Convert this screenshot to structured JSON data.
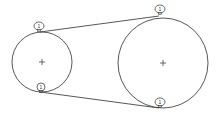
{
  "diagram": {
    "type": "belt-pulley",
    "stroke_color": "#444444",
    "background": "#ffffff",
    "pulleys": [
      {
        "id": "small-pulley",
        "cx": 42,
        "cy": 62,
        "r": 30,
        "center_mark": "+"
      },
      {
        "id": "large-pulley",
        "cx": 163,
        "cy": 63,
        "r": 45,
        "center_mark": "+"
      }
    ],
    "belt_segments": [
      {
        "id": "upper-belt",
        "x1": 40,
        "y1": 32,
        "x2": 159,
        "y2": 16
      },
      {
        "id": "lower-belt",
        "x1": 40,
        "y1": 92,
        "x2": 159,
        "y2": 108
      }
    ],
    "tangent_labels": [
      {
        "id": "label-small-top",
        "cx": 39,
        "cy": 26,
        "rx": 5,
        "ry": 4,
        "text": "1"
      },
      {
        "id": "label-small-bottom",
        "cx": 41,
        "cy": 87,
        "rx": 4,
        "ry": 4,
        "text": "1"
      },
      {
        "id": "label-large-top",
        "cx": 160,
        "cy": 9,
        "rx": 5,
        "ry": 4,
        "text": "1"
      },
      {
        "id": "label-large-bottom",
        "cx": 160,
        "cy": 102,
        "rx": 5,
        "ry": 4,
        "text": "1"
      }
    ]
  }
}
